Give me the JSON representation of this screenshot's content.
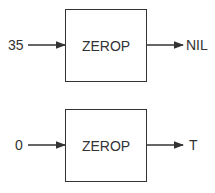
{
  "diagram": {
    "blocks": [
      {
        "function": "ZEROP",
        "input": "35",
        "output": "NIL"
      },
      {
        "function": "ZEROP",
        "input": "0",
        "output": "T"
      }
    ]
  }
}
